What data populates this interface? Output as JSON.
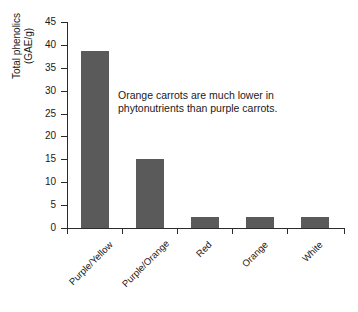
{
  "chart_data": {
    "type": "bar",
    "title": "",
    "subtitle": "",
    "xlabel": "",
    "ylabel": "Total phenolics (GAE/g)",
    "ylabel_lines": [
      "Total phenolics",
      "(GAE/g)"
    ],
    "categories": [
      "Purple/Yellow",
      "Purple/Orange",
      "Red",
      "Orange",
      "White"
    ],
    "values": [
      38.7,
      15.0,
      2.4,
      2.5,
      2.5
    ],
    "ylim": [
      0,
      45
    ],
    "ytick_values": [
      0,
      5,
      10,
      15,
      20,
      25,
      30,
      35,
      40,
      45
    ],
    "ytick_labels": [
      "0",
      "5",
      "10",
      "15",
      "20",
      "25",
      "30",
      "35",
      "40",
      "45"
    ],
    "grid": false,
    "legend": null,
    "legend_position": "none",
    "bar_color": "#5a5a5a",
    "axis_color": "#2b2b2b",
    "background_color": "#ffffff",
    "annotations": [
      {
        "text": "Orange carrots are much lower in phytonutrients than purple carrots.",
        "lines": [
          "Orange carrots are much lower in",
          "phytonutrients than purple carrots."
        ]
      }
    ]
  }
}
